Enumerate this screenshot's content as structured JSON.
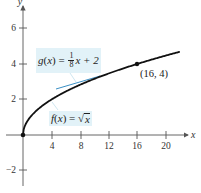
{
  "chart_data": {
    "type": "line",
    "title": "",
    "xlabel": "x",
    "ylabel": "y",
    "xlim": [
      0,
      23
    ],
    "ylim": [
      -2.5,
      7
    ],
    "x_ticks": [
      4,
      8,
      12,
      16,
      20
    ],
    "y_ticks": [
      -2,
      2,
      4,
      6
    ],
    "grid": false,
    "series": [
      {
        "name": "f(x) = √x",
        "type": "curve",
        "color": "#111111",
        "x": [
          0,
          0.25,
          1,
          2,
          4,
          6,
          8,
          10,
          12,
          14,
          16,
          18,
          20,
          22
        ],
        "y": [
          0,
          0.5,
          1,
          1.414,
          2,
          2.449,
          2.828,
          3.162,
          3.464,
          3.742,
          4,
          4.243,
          4.472,
          4.69
        ]
      },
      {
        "name": "g(x) = (1/8)x + 2",
        "type": "line-segment",
        "color": "#3a8fc4",
        "x": [
          4.6,
          10.8
        ],
        "y": [
          2.575,
          3.35
        ]
      }
    ],
    "points": [
      {
        "x": 0,
        "y": 0,
        "label": ""
      },
      {
        "x": 16,
        "y": 4,
        "label": "(16, 4)"
      }
    ],
    "annotations": [
      {
        "text": "g(x) = 1/8 x + 2",
        "target": "tangent line"
      },
      {
        "text": "f(x) = √x",
        "target": "curve"
      },
      {
        "text": "(16, 4)",
        "target": "point of tangency"
      }
    ]
  },
  "labels": {
    "x_axis": "x",
    "y_axis": "y",
    "x_ticks": [
      "4",
      "8",
      "12",
      "16",
      "20"
    ],
    "y_ticks": [
      "6",
      "4",
      "2",
      "−2"
    ],
    "point": "(16, 4)",
    "g": {
      "name": "g",
      "var": "x",
      "num": "1",
      "den": "8",
      "rest": "x + 2"
    },
    "f": {
      "name": "f",
      "var": "x",
      "radicand": "x"
    }
  },
  "colors": {
    "curve": "#111111",
    "tangent": "#3a8fc4",
    "label_bg": "#e2f2f8",
    "axis": "#555555"
  }
}
